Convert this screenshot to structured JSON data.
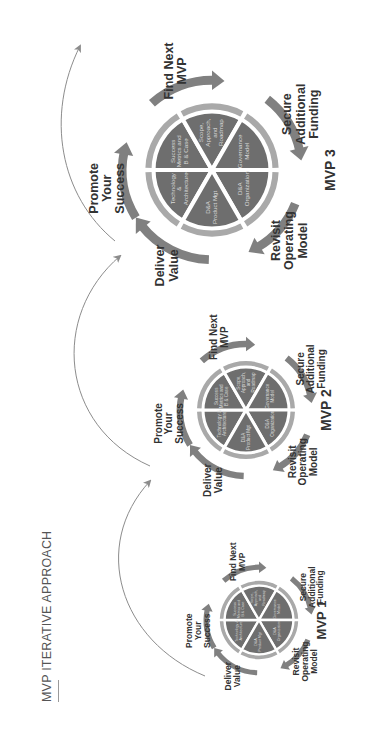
{
  "title": "MVP ITERATIVE APPROACH",
  "colors": {
    "wheel_fill": "#6e6e6e",
    "ring": "#a9a9a9",
    "arrow": "#808080",
    "connector": "#8c8c8c",
    "stage_text": "#333333",
    "segment_text": "#d8d8d8"
  },
  "wheels": [
    {
      "name": "MVP 1",
      "label": "MVP 1",
      "stages": {
        "promote": "Promote\nYour\nSuccess",
        "find": "Find Next\nMVP",
        "secure": "Secure\nAdditional\nFunding",
        "revisit": "Revisit\nOperating\nModel",
        "deliver": "Deliver\nValue"
      },
      "segments": [
        "Technology &\nArchitecture",
        "Success\nMetrics and\nB & Case",
        "Scope,\nApproach,\nand\nRoadmap",
        "Governance\nModel",
        "D&A\nOrganization",
        "D&A\nProduct Mgt"
      ]
    },
    {
      "name": "MVP 2",
      "label": "MVP 2",
      "stages": {
        "promote": "Promote\nYour\nSuccess",
        "find": "Find Next\nMVP",
        "secure": "Secure\nAdditional\nFunding",
        "revisit": "Revisit\nOperating\nModel",
        "deliver": "Deliver\nValue"
      },
      "segments": [
        "Technology &\nArchitecture",
        "Success\nMetrics and\nB & Case",
        "Scope,\nApproach,\nand\nRoadmap",
        "Governance\nModel",
        "D&A\nOrganization",
        "D&A\nProduct Mgt"
      ]
    },
    {
      "name": "MVP 3",
      "label": "MVP 3",
      "stages": {
        "promote": "Promote\nYour\nSuccess",
        "find": "Find Next\nMVP",
        "secure": "Secure\nAdditional\nFunding",
        "revisit": "Revisit\nOperating\nModel",
        "deliver": "Deliver\nValue"
      },
      "segments": [
        "Technology\n&\nArchitecture",
        "Success\nMetrics and\nB & Case",
        "Scope,\nApproach,\nand\nRoadmap",
        "Governance\nModel",
        "D&A\nOrganization",
        "D&A\nProduct Mgt"
      ]
    }
  ]
}
